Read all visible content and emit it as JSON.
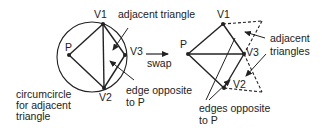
{
  "diagram": {
    "left": {
      "vertices": {
        "P": "P",
        "V1": "V1",
        "V2": "V2",
        "V3": "V3"
      },
      "annotations": {
        "adjacent_triangle": "adjacent triangle",
        "edge_opposite_line1": "edge opposite",
        "edge_opposite_line2": "to P",
        "circumcircle_line1": "circumcircle",
        "circumcircle_line2": "for adjacent",
        "circumcircle_line3": "triangle"
      }
    },
    "transition": {
      "label": "swap"
    },
    "right": {
      "vertices": {
        "P": "P",
        "V1": "V1",
        "V2": "V2",
        "V3": "V3"
      },
      "annotations": {
        "adjacent_triangles_line1": "adjacent",
        "adjacent_triangles_line2": "triangles",
        "edges_opposite_line1": "edges opposite",
        "edges_opposite_line2": "to P"
      }
    },
    "colors": {
      "stroke": "#222222",
      "background": "#ffffff"
    }
  }
}
